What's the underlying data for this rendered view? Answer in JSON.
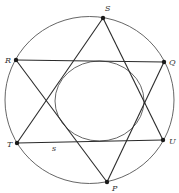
{
  "diagram": {
    "type": "geometry",
    "outer_circle": {
      "cx": 89.5,
      "cy": 100,
      "rx": 84.5,
      "ry": 83.5
    },
    "inner_circle": {
      "cx": 99.5,
      "cy": 101,
      "rx": 44.5,
      "ry": 40
    },
    "points": [
      {
        "id": "S",
        "label": "S",
        "x": 103,
        "y": 18,
        "lx": 105,
        "ly": 11
      },
      {
        "id": "R",
        "label": "R",
        "x": 16,
        "y": 60,
        "lx": 5,
        "ly": 63
      },
      {
        "id": "Q",
        "label": "Q",
        "x": 164,
        "y": 62,
        "lx": 169,
        "ly": 65
      },
      {
        "id": "T",
        "label": "T",
        "x": 17,
        "y": 143,
        "lx": 7,
        "ly": 147
      },
      {
        "id": "U",
        "label": "U",
        "x": 163,
        "y": 140,
        "lx": 169,
        "ly": 144
      },
      {
        "id": "P",
        "label": "P",
        "x": 107,
        "y": 182,
        "lx": 112,
        "ly": 191
      }
    ],
    "segments": [
      {
        "from": "S",
        "to": "T"
      },
      {
        "from": "S",
        "to": "U"
      },
      {
        "from": "T",
        "to": "U"
      },
      {
        "from": "R",
        "to": "Q"
      },
      {
        "from": "R",
        "to": "P"
      },
      {
        "from": "Q",
        "to": "P"
      }
    ],
    "annotations": [
      {
        "text": "s",
        "x": 52,
        "y": 151,
        "refers_to": "segment TU"
      }
    ]
  }
}
